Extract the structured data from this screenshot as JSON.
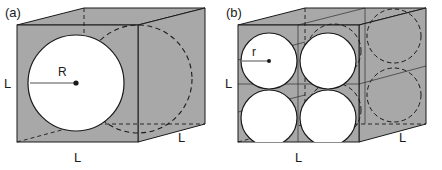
{
  "figure": {
    "type": "geometry-diagram",
    "background_color": "#ffffff",
    "face_fill_color": "#a8a8a8",
    "sphere_fill_color": "#ffffff",
    "line_color": "#1a1a1a"
  },
  "panels": [
    {
      "tag": "(a)",
      "content": "single sphere of radius R inscribed in a cube of edge L",
      "sphere_count": 1,
      "radius_label": "R",
      "dim_left": "L",
      "dim_bottom": "L",
      "dim_right": "L"
    },
    {
      "tag": "(b)",
      "content": "eight spheres of radius r packed in a cube of edge L",
      "sphere_count": 8,
      "radius_label": "r",
      "dim_left": "L",
      "dim_bottom": "L",
      "dim_right": "L"
    }
  ]
}
